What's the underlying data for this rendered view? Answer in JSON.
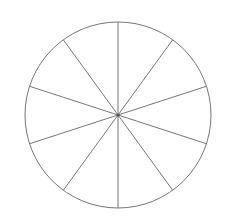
{
  "figure": {
    "name": "blank-fraction-circle",
    "title": "",
    "background_color": "#ffffff",
    "width": 231,
    "height": 224
  },
  "chart_data": {
    "type": "pie",
    "title": "",
    "xlabel": "",
    "ylabel": "",
    "categories": [
      "Sector 1",
      "Sector 2",
      "Sector 3",
      "Sector 4",
      "Sector 5",
      "Sector 6",
      "Sector 7",
      "Sector 8",
      "Sector 9",
      "Sector 10"
    ],
    "values": [
      10,
      10,
      10,
      10,
      10,
      10,
      10,
      10,
      10,
      10
    ],
    "slice_count": 10,
    "slice_angle_degrees": 36,
    "slice_fraction": "1/10",
    "fill_colors": [
      "#ffffff",
      "#ffffff",
      "#ffffff",
      "#ffffff",
      "#ffffff",
      "#ffffff",
      "#ffffff",
      "#ffffff",
      "#ffffff",
      "#ffffff"
    ],
    "legend": [],
    "legend_position": "none",
    "labels_shown": false,
    "grid": false
  },
  "geometry": {
    "center_x": 118,
    "center_y": 115,
    "radius": 93,
    "outline_color": "#777777",
    "spoke_color": "#777777",
    "fill_color": "#ffffff",
    "outline_width": 1,
    "spoke_width": 1,
    "start_angle_degrees": -90,
    "spoke_angles_degrees": [
      -90,
      -54,
      -18,
      18,
      54,
      90,
      126,
      162,
      198,
      234
    ],
    "center_dot_color": "#555555",
    "center_dot_radius": 1.6
  },
  "accessibility": {
    "figure_role": "image",
    "figure_description": "Circle divided into ten equal unshaded sectors"
  }
}
